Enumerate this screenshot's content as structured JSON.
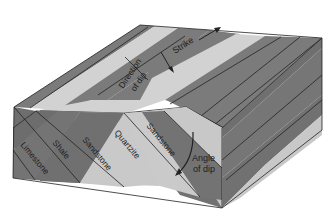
{
  "diagram": {
    "type": "geological-block-diagram",
    "colors": {
      "dark_layer": "#7b7b7b",
      "dark_layer_side": "#6e6e6e",
      "light_layer": "#d2d2d2",
      "light_layer_side": "#c4c4c4",
      "line": "#222222",
      "background": "#ffffff"
    },
    "layers": [
      {
        "name": "Limestone",
        "tone": "dark"
      },
      {
        "name": "Shale",
        "tone": "dark"
      },
      {
        "name": "Sandstone",
        "tone": "light"
      },
      {
        "name": "Quartzite",
        "tone": "dark"
      },
      {
        "name": "Sandstone",
        "tone": "light"
      }
    ],
    "labels": {
      "limestone": "Limestone",
      "shale": "Shale",
      "sandstone_1": "Sandstone",
      "quartzite": "Quartzite",
      "sandstone_2": "Sandstone",
      "strike": "Strike",
      "direction_of_dip_line1": "Direction",
      "direction_of_dip_line2": "of dip",
      "angle_of_dip_line1": "Angle",
      "angle_of_dip_line2": "of dip"
    },
    "annotations": [
      {
        "name": "strike-arrow",
        "label": "Strike"
      },
      {
        "name": "direction-of-dip-arrow",
        "label": "Direction of dip"
      },
      {
        "name": "angle-of-dip-arc",
        "label": "Angle of dip"
      }
    ]
  }
}
